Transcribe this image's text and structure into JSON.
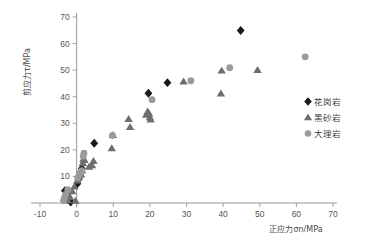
{
  "chart_data": {
    "type": "scatter",
    "title": "",
    "xlabel": "正应力σn/MPa",
    "ylabel": "剪应力τ/MPa",
    "xlim": [
      -10,
      70
    ],
    "ylim": [
      0,
      70
    ],
    "xticks": [
      -10,
      0,
      10,
      20,
      30,
      40,
      50,
      60,
      70
    ],
    "yticks": [
      0,
      10,
      20,
      30,
      40,
      50,
      60,
      70
    ],
    "xtick_labels": [
      "-10",
      "0",
      "10",
      "20",
      "30",
      "40",
      "50",
      "60",
      "70"
    ],
    "ytick_labels": [
      "0",
      "10",
      "20",
      "30",
      "40",
      "50",
      "60",
      "70"
    ],
    "grid": false,
    "legend_position": "right",
    "series": [
      {
        "name": "花岗岩",
        "marker": "diamond",
        "color": "#1a1a1a",
        "points": [
          [
            -3.2,
            4.6
          ],
          [
            -2.6,
            3.4
          ],
          [
            -2.0,
            1.2
          ],
          [
            -1.6,
            0.4
          ],
          [
            0.2,
            7.2
          ],
          [
            0.6,
            9.0
          ],
          [
            1.0,
            11.5
          ],
          [
            1.4,
            13.0
          ],
          [
            4.8,
            22.5
          ],
          [
            19.6,
            41.3
          ],
          [
            24.8,
            45.3
          ],
          [
            44.8,
            64.9
          ]
        ]
      },
      {
        "name": "黑砂岩",
        "marker": "triangle",
        "color": "#6e6e6e",
        "points": [
          [
            -2.4,
            1.0
          ],
          [
            -1.8,
            2.2
          ],
          [
            -1.2,
            4.4
          ],
          [
            -0.6,
            6.2
          ],
          [
            -0.3,
            0.8
          ],
          [
            0.2,
            8.4
          ],
          [
            0.5,
            9.6
          ],
          [
            0.8,
            10.6
          ],
          [
            1.0,
            11.0
          ],
          [
            1.2,
            10.8
          ],
          [
            1.5,
            12.2
          ],
          [
            1.7,
            15.0
          ],
          [
            1.9,
            16.6
          ],
          [
            2.1,
            16.2
          ],
          [
            3.4,
            13.6
          ],
          [
            4.2,
            14.2
          ],
          [
            4.6,
            15.8
          ],
          [
            9.6,
            20.6
          ],
          [
            9.9,
            25.6
          ],
          [
            14.2,
            31.6
          ],
          [
            14.6,
            28.6
          ],
          [
            19.0,
            33.2
          ],
          [
            19.4,
            34.4
          ],
          [
            19.8,
            33.6
          ],
          [
            20.0,
            32.2
          ],
          [
            20.2,
            31.4
          ],
          [
            29.2,
            45.7
          ],
          [
            39.4,
            41.2
          ],
          [
            39.6,
            49.8
          ],
          [
            49.4,
            50.0
          ]
        ]
      },
      {
        "name": "大理岩",
        "marker": "circle",
        "color": "#9a9a9a",
        "points": [
          [
            -3.6,
            0.9
          ],
          [
            -3.3,
            2.0
          ],
          [
            -3.0,
            3.2
          ],
          [
            -2.4,
            5.0
          ],
          [
            0.3,
            9.4
          ],
          [
            0.7,
            10.6
          ],
          [
            1.1,
            11.6
          ],
          [
            1.4,
            12.2
          ],
          [
            1.8,
            17.6
          ],
          [
            2.0,
            18.8
          ],
          [
            9.8,
            25.4
          ],
          [
            20.6,
            38.9
          ],
          [
            31.2,
            46.0
          ],
          [
            41.8,
            50.9
          ],
          [
            62.4,
            55.0
          ]
        ]
      }
    ]
  },
  "legend": {
    "items": [
      {
        "label": "花岗岩",
        "marker": "diamond",
        "color": "#1a1a1a"
      },
      {
        "label": "黑砂岩",
        "marker": "triangle",
        "color": "#6e6e6e"
      },
      {
        "label": "大理岩",
        "marker": "circle",
        "color": "#9a9a9a"
      }
    ]
  }
}
